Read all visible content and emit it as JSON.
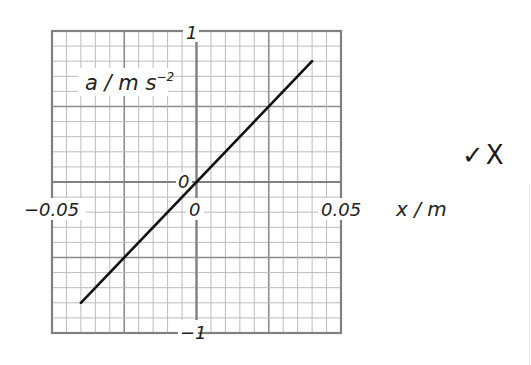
{
  "chart_data": {
    "type": "line",
    "title": "",
    "xlabel": "x / m",
    "ylabel": "a / m s-2",
    "ylabel_display": {
      "base": "a / m s",
      "superscript": "-2"
    },
    "xlim": [
      -0.05,
      0.05
    ],
    "ylim": [
      -1,
      1
    ],
    "x_ticks": [
      "-0.05",
      "0",
      "0.05"
    ],
    "y_ticks": [
      "1",
      "0",
      "-1"
    ],
    "origin_label": "0",
    "grid": true,
    "grid_minor_divisions": 20,
    "grid_major_every": 5,
    "series": [
      {
        "name": "a vs x",
        "x": [
          -0.04,
          0.0,
          0.04
        ],
        "y": [
          -0.8,
          0.0,
          0.8
        ],
        "color": "#111111"
      }
    ],
    "colors": {
      "grid_minor": "#bcbcbc",
      "grid_major": "#8c8c8c",
      "line": "#111111"
    }
  },
  "annotations": {
    "marks": "✓X"
  },
  "labels": {
    "x_neg": "−0.05",
    "x_zero": "0",
    "x_pos": "0.05",
    "y_top": "1",
    "y_zero": "0",
    "y_bottom": "−1",
    "x_axis": "x / m",
    "y_axis_base": "a / m s",
    "y_axis_sup": "−2"
  }
}
